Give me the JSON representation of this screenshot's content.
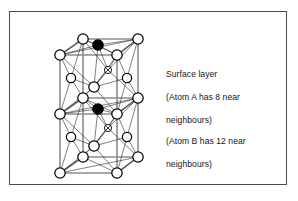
{
  "figure": {
    "title_text": "",
    "frame": {
      "border_color": "#4d4d4d",
      "background": "#ffffff"
    },
    "captions": {
      "surface": {
        "lines": [
          "Surface layer",
          "(Atom A has 8 near",
          "neighbours)"
        ]
      },
      "atom_b": {
        "lines": [
          "(Atom B has 12 near",
          "neighbours)"
        ]
      }
    },
    "legend": {
      "open_circle_label": "open-circle-atom",
      "filled_circle_label": "filled-circle-atom",
      "crossed_circle_label": "crossed-circle-atom"
    },
    "colors": {
      "atom_open_fill": "#ffffff",
      "atom_filled_fill": "#000000",
      "atom_stroke": "#000000",
      "bond_color": "#1a1a1a",
      "cell_edge_color": "#8c8c8c"
    },
    "lattice": {
      "structure_name": "face-centred cubic double cell",
      "cell_count": 2,
      "atom_a_label": "A",
      "atom_b_label": "B",
      "atom_a_near_neighbours": 8,
      "atom_b_near_neighbours": 12,
      "cell_edges": [
        [
          78,
          32,
          133,
          32
        ],
        [
          133,
          32,
          133,
          150
        ],
        [
          133,
          150,
          78,
          150
        ],
        [
          78,
          150,
          78,
          32
        ],
        [
          55,
          48,
          112,
          48
        ],
        [
          112,
          48,
          112,
          166
        ],
        [
          112,
          166,
          55,
          166
        ],
        [
          55,
          166,
          55,
          48
        ],
        [
          78,
          32,
          55,
          48
        ],
        [
          133,
          32,
          112,
          48
        ],
        [
          133,
          150,
          112,
          166
        ],
        [
          78,
          150,
          55,
          166
        ],
        [
          78,
          91,
          133,
          91
        ],
        [
          55,
          107,
          112,
          107
        ],
        [
          78,
          91,
          55,
          107
        ],
        [
          133,
          91,
          112,
          107
        ]
      ],
      "atoms": [
        {
          "id": "c1",
          "x": 78,
          "y": 32,
          "r": 5.2,
          "type": "open"
        },
        {
          "id": "c2",
          "x": 133,
          "y": 32,
          "r": 5.2,
          "type": "open"
        },
        {
          "id": "c3",
          "x": 55,
          "y": 48,
          "r": 5.2,
          "type": "open"
        },
        {
          "id": "c4",
          "x": 112,
          "y": 48,
          "r": 5.2,
          "type": "open"
        },
        {
          "id": "fA",
          "x": 93,
          "y": 38,
          "r": 5.2,
          "type": "filled"
        },
        {
          "id": "bc1",
          "x": 103,
          "y": 63,
          "r": 3.6,
          "type": "crossed"
        },
        {
          "id": "lf1",
          "x": 66,
          "y": 71,
          "r": 4.6,
          "type": "open"
        },
        {
          "id": "rf1",
          "x": 122,
          "y": 71,
          "r": 4.6,
          "type": "open"
        },
        {
          "id": "fc1",
          "x": 89,
          "y": 80,
          "r": 5.2,
          "type": "open"
        },
        {
          "id": "m1",
          "x": 78,
          "y": 91,
          "r": 5.2,
          "type": "open"
        },
        {
          "id": "m2",
          "x": 133,
          "y": 91,
          "r": 5.2,
          "type": "open"
        },
        {
          "id": "m3",
          "x": 55,
          "y": 107,
          "r": 5.2,
          "type": "open"
        },
        {
          "id": "m4",
          "x": 112,
          "y": 107,
          "r": 5.2,
          "type": "open"
        },
        {
          "id": "fB",
          "x": 93,
          "y": 102,
          "r": 5.2,
          "type": "filled"
        },
        {
          "id": "bc2",
          "x": 103,
          "y": 121,
          "r": 3.6,
          "type": "crossed"
        },
        {
          "id": "lf2",
          "x": 66,
          "y": 130,
          "r": 4.6,
          "type": "open"
        },
        {
          "id": "rf2",
          "x": 122,
          "y": 130,
          "r": 4.6,
          "type": "open"
        },
        {
          "id": "fc2",
          "x": 89,
          "y": 139,
          "r": 5.2,
          "type": "open"
        },
        {
          "id": "c5",
          "x": 78,
          "y": 150,
          "r": 5.2,
          "type": "open"
        },
        {
          "id": "c6",
          "x": 133,
          "y": 150,
          "r": 5.2,
          "type": "open"
        },
        {
          "id": "c7",
          "x": 55,
          "y": 166,
          "r": 5.2,
          "type": "open"
        },
        {
          "id": "c8",
          "x": 112,
          "y": 166,
          "r": 5.2,
          "type": "open"
        }
      ],
      "bonds": [
        [
          78,
          32,
          93,
          38
        ],
        [
          93,
          38,
          133,
          32
        ],
        [
          93,
          38,
          55,
          48
        ],
        [
          93,
          38,
          112,
          48
        ],
        [
          78,
          32,
          55,
          48
        ],
        [
          133,
          32,
          112,
          48
        ],
        [
          78,
          32,
          103,
          63
        ],
        [
          133,
          32,
          103,
          63
        ],
        [
          112,
          48,
          103,
          63
        ],
        [
          93,
          38,
          103,
          63
        ],
        [
          78,
          32,
          66,
          71
        ],
        [
          55,
          48,
          66,
          71
        ],
        [
          78,
          91,
          66,
          71
        ],
        [
          55,
          107,
          66,
          71
        ],
        [
          133,
          32,
          122,
          71
        ],
        [
          112,
          48,
          122,
          71
        ],
        [
          133,
          91,
          122,
          71
        ],
        [
          112,
          107,
          122,
          71
        ],
        [
          55,
          48,
          89,
          80
        ],
        [
          112,
          48,
          89,
          80
        ],
        [
          55,
          107,
          89,
          80
        ],
        [
          112,
          107,
          89,
          80
        ],
        [
          93,
          38,
          89,
          80
        ],
        [
          66,
          71,
          89,
          80
        ],
        [
          122,
          71,
          89,
          80
        ],
        [
          103,
          63,
          89,
          80
        ],
        [
          78,
          91,
          103,
          63
        ],
        [
          133,
          91,
          103,
          63
        ],
        [
          78,
          91,
          93,
          102
        ],
        [
          93,
          102,
          133,
          91
        ],
        [
          93,
          102,
          55,
          107
        ],
        [
          93,
          102,
          112,
          107
        ],
        [
          78,
          91,
          55,
          107
        ],
        [
          133,
          91,
          112,
          107
        ],
        [
          78,
          91,
          103,
          121
        ],
        [
          133,
          91,
          103,
          121
        ],
        [
          112,
          107,
          103,
          121
        ],
        [
          93,
          102,
          103,
          121
        ],
        [
          78,
          91,
          66,
          130
        ],
        [
          55,
          107,
          66,
          130
        ],
        [
          78,
          150,
          66,
          130
        ],
        [
          55,
          166,
          66,
          130
        ],
        [
          133,
          91,
          122,
          130
        ],
        [
          112,
          107,
          122,
          130
        ],
        [
          133,
          150,
          122,
          130
        ],
        [
          112,
          166,
          122,
          130
        ],
        [
          55,
          107,
          89,
          139
        ],
        [
          112,
          107,
          89,
          139
        ],
        [
          55,
          166,
          89,
          139
        ],
        [
          112,
          166,
          89,
          139
        ],
        [
          93,
          102,
          89,
          139
        ],
        [
          66,
          130,
          89,
          139
        ],
        [
          122,
          130,
          89,
          139
        ],
        [
          103,
          121,
          89,
          139
        ],
        [
          78,
          150,
          103,
          121
        ],
        [
          133,
          150,
          103,
          121
        ],
        [
          78,
          150,
          55,
          166
        ],
        [
          133,
          150,
          112,
          166
        ],
        [
          78,
          150,
          112,
          166
        ],
        [
          133,
          150,
          55,
          166
        ],
        [
          78,
          32,
          112,
          48
        ],
        [
          133,
          32,
          55,
          48
        ],
        [
          78,
          91,
          112,
          107
        ],
        [
          133,
          91,
          55,
          107
        ]
      ]
    }
  }
}
